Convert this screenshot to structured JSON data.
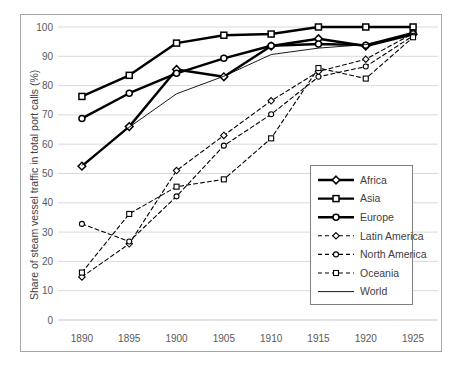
{
  "chart_data": {
    "type": "line",
    "title": "",
    "xlabel": "",
    "ylabel": "Share of steam vessel traffic in total port calls (%)",
    "x": [
      1890,
      1895,
      1900,
      1905,
      1910,
      1915,
      1920,
      1925
    ],
    "xticklabels": [
      "1890",
      "1895",
      "1900",
      "1905",
      "1910",
      "1915",
      "1920",
      "1925"
    ],
    "yticklabels": [
      "0",
      "10",
      "20",
      "30",
      "40",
      "50",
      "60",
      "70",
      "80",
      "90",
      "100"
    ],
    "yticks": [
      0,
      10,
      20,
      30,
      40,
      50,
      60,
      70,
      80,
      90,
      100
    ],
    "ylim": [
      0,
      100
    ],
    "xlim": [
      1888,
      1927
    ],
    "grid": "horizontal",
    "legend_position": "inside-right-lower",
    "series": [
      {
        "name": "Africa",
        "values": [
          52.5,
          66.0,
          85.5,
          83.0,
          93.5,
          96.0,
          93.5,
          97.5
        ],
        "marker": "diamond",
        "line": "solid",
        "width": 2.4
      },
      {
        "name": "Asia",
        "values": [
          76.3,
          83.5,
          94.5,
          97.2,
          97.6,
          100.0,
          100.0,
          100.0
        ],
        "marker": "square",
        "line": "solid",
        "width": 2.4
      },
      {
        "name": "Europe",
        "values": [
          68.8,
          77.4,
          84.2,
          89.3,
          93.6,
          94.2,
          93.8,
          98.0
        ],
        "marker": "circle",
        "line": "solid",
        "width": 2.4
      },
      {
        "name": "Latin America",
        "values": [
          14.7,
          26.0,
          51.0,
          63.0,
          74.8,
          84.8,
          89.0,
          97.8
        ],
        "marker": "diamond",
        "line": "dashed",
        "width": 1.1
      },
      {
        "name": "North America",
        "values": [
          32.8,
          26.8,
          42.2,
          59.5,
          70.2,
          83.0,
          86.5,
          97.0
        ],
        "marker": "circle",
        "line": "dashed",
        "width": 1.1
      },
      {
        "name": "Oceania",
        "values": [
          16.2,
          36.2,
          45.5,
          48.0,
          62.0,
          86.0,
          82.4,
          96.5
        ],
        "marker": "square",
        "line": "dashed",
        "width": 1.1
      },
      {
        "name": "World",
        "values": [
          52.8,
          65.8,
          77.2,
          83.2,
          90.6,
          92.8,
          94.0,
          97.6
        ],
        "marker": "none",
        "line": "solid",
        "width": 0.9
      }
    ],
    "colors": {
      "line": "#000000",
      "grid": "#d9d9d9",
      "text": "#595959",
      "border": "#a6a6a6",
      "marker_fill": "#ffffff"
    }
  },
  "legend": {
    "items": [
      {
        "label": "Africa"
      },
      {
        "label": "Asia"
      },
      {
        "label": "Europe"
      },
      {
        "label": "Latin America"
      },
      {
        "label": "North America"
      },
      {
        "label": "Oceania"
      },
      {
        "label": "World"
      }
    ]
  }
}
